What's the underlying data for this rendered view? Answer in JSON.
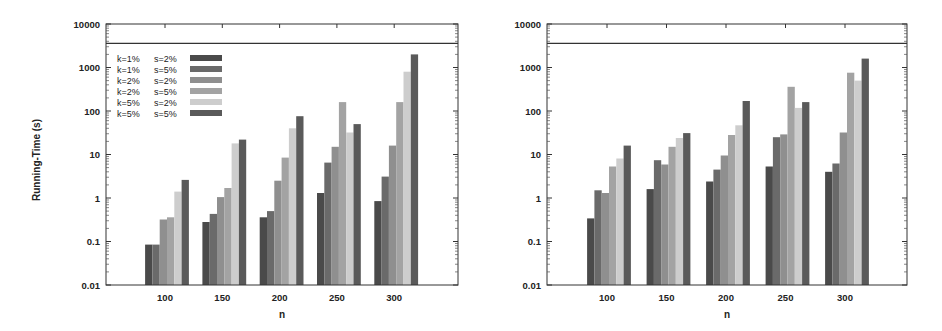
{
  "chart_data": [
    {
      "type": "bar",
      "title": "",
      "xlabel": "n",
      "ylabel": "Running-Time (s)",
      "yscale": "log",
      "ylim": [
        0.01,
        10000
      ],
      "yticks": [
        "0.01",
        "0.1",
        "1",
        "10",
        "100",
        "1000",
        "10000"
      ],
      "grid": false,
      "timeout_line": 3600,
      "legend_position": "upper left",
      "categories": [
        "100",
        "150",
        "200",
        "250",
        "300"
      ],
      "series": [
        {
          "name": "k=1%  s=2%",
          "values": [
            0.085,
            0.28,
            0.36,
            1.3,
            0.85
          ]
        },
        {
          "name": "k=1%  s=5%",
          "values": [
            0.085,
            0.43,
            0.5,
            6.5,
            3.1
          ]
        },
        {
          "name": "k=2%  s=2%",
          "values": [
            0.32,
            1.05,
            2.5,
            15,
            16
          ]
        },
        {
          "name": "k=2%  s=5%",
          "values": [
            0.36,
            1.7,
            8.5,
            160,
            160
          ]
        },
        {
          "name": "k=5%  s=2%",
          "values": [
            1.4,
            18,
            40,
            32,
            800
          ]
        },
        {
          "name": "k=5%  s=5%",
          "values": [
            2.6,
            22,
            76,
            50,
            2000
          ]
        }
      ]
    },
    {
      "type": "bar",
      "title": "",
      "xlabel": "n",
      "ylabel": "",
      "yscale": "log",
      "ylim": [
        0.01,
        10000
      ],
      "yticks": [
        "0.01",
        "0.1",
        "1",
        "10",
        "100",
        "1000",
        "10000"
      ],
      "grid": false,
      "timeout_line": 3600,
      "categories": [
        "100",
        "150",
        "200",
        "250",
        "300"
      ],
      "series": [
        {
          "name": "k=1%  s=2%",
          "values": [
            0.34,
            1.6,
            2.4,
            5.3,
            4.0
          ]
        },
        {
          "name": "k=1%  s=5%",
          "values": [
            1.5,
            7.4,
            4.5,
            25,
            6.2
          ]
        },
        {
          "name": "k=2%  s=2%",
          "values": [
            1.3,
            5.9,
            9.5,
            29,
            32
          ]
        },
        {
          "name": "k=2%  s=5%",
          "values": [
            5.3,
            15,
            28,
            360,
            760
          ]
        },
        {
          "name": "k=5%  s=2%",
          "values": [
            8.1,
            24,
            47,
            118,
            500
          ]
        },
        {
          "name": "k=5%  s=5%",
          "values": [
            16,
            31,
            170,
            160,
            1600
          ]
        }
      ]
    }
  ],
  "legend": {
    "items": [
      {
        "k": "k=1%",
        "s": "s=2%"
      },
      {
        "k": "k=1%",
        "s": "s=5%"
      },
      {
        "k": "k=2%",
        "s": "s=2%"
      },
      {
        "k": "k=2%",
        "s": "s=5%"
      },
      {
        "k": "k=5%",
        "s": "s=2%"
      },
      {
        "k": "k=5%",
        "s": "s=5%"
      }
    ]
  },
  "colors": [
    "#4a4a4a",
    "#6a6a6a",
    "#8f8f8f",
    "#a3a3a3",
    "#cdcdcd",
    "#5a5a5a"
  ]
}
